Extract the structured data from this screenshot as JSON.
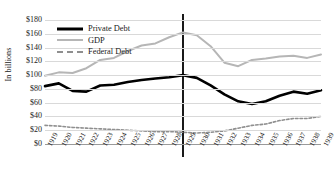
{
  "chart_data": {
    "type": "line",
    "title": "",
    "xlabel": "",
    "ylabel": "In billions",
    "ylim": [
      0,
      180
    ],
    "ytick_step": 20,
    "grid": true,
    "legend_position": "top-left",
    "x": [
      1919,
      1920,
      1921,
      1922,
      1923,
      1924,
      1925,
      1926,
      1927,
      1928,
      1929,
      1930,
      1931,
      1932,
      1933,
      1934,
      1935,
      1936,
      1937,
      1938,
      1939
    ],
    "ytick_labels": [
      "$0",
      "$20",
      "$40",
      "$60",
      "$80",
      "$100",
      "$120",
      "$140",
      "$160",
      "$180"
    ],
    "ytick_values": [
      0,
      20,
      40,
      60,
      80,
      100,
      120,
      140,
      160,
      180
    ],
    "xtick_labels": [
      "1919",
      "1920",
      "1921",
      "1922",
      "1923",
      "1924",
      "1925",
      "1926",
      "1927",
      "1928",
      "1929",
      "1930",
      "1931",
      "1932",
      "1933",
      "1934",
      "1935",
      "1936",
      "1937",
      "1938",
      "1939"
    ],
    "annotations": [
      {
        "name": "crash-marker-1929",
        "type": "vline",
        "x": 1929,
        "color": "#000000"
      }
    ],
    "series": [
      {
        "name": "Private Debt",
        "color": "#000000",
        "style": "solid-thick",
        "values": [
          84,
          88,
          77,
          76,
          85,
          86,
          90,
          93,
          95,
          97,
          100,
          96,
          85,
          72,
          62,
          58,
          62,
          70,
          76,
          73,
          78
        ]
      },
      {
        "name": "GDP",
        "color": "#b6b6b6",
        "style": "solid",
        "values": [
          99,
          104,
          103,
          110,
          122,
          125,
          135,
          143,
          146,
          155,
          162,
          158,
          142,
          118,
          113,
          122,
          124,
          127,
          128,
          125,
          130
        ]
      },
      {
        "name": "Federal Debt",
        "color": "#8f8f8f",
        "style": "dashed",
        "values": [
          27,
          26,
          24,
          23,
          22,
          21,
          20,
          19,
          18,
          18,
          17,
          16,
          17,
          19,
          23,
          27,
          29,
          34,
          37,
          37,
          40
        ]
      }
    ]
  },
  "legend": {
    "items": [
      {
        "label": "Private Debt"
      },
      {
        "label": "GDP"
      },
      {
        "label": "Federal Debt"
      }
    ]
  }
}
